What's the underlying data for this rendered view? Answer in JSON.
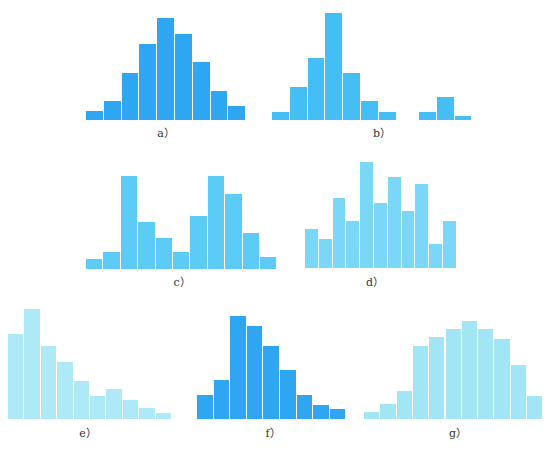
{
  "chart_data": [
    {
      "id": "a",
      "type": "bar",
      "label": "a）",
      "color": "#2ea6f2",
      "x": 86,
      "baseline": 120,
      "bar_width": 17.8,
      "values": [
        9,
        19,
        47,
        76,
        102,
        86,
        58,
        29,
        14
      ],
      "title": "",
      "xlabel": "",
      "ylabel": ""
    },
    {
      "id": "b",
      "type": "bar",
      "label": "b）",
      "color": "#45bdf5",
      "x": 272,
      "baseline": 120,
      "bar_width": 17.8,
      "values": [
        8,
        33,
        62,
        107,
        47,
        19,
        8
      ],
      "gap_group": {
        "x": 419,
        "values": [
          8,
          23,
          4
        ]
      },
      "title": "",
      "xlabel": "",
      "ylabel": ""
    },
    {
      "id": "c",
      "type": "bar",
      "label": "c）",
      "color": "#5ccbf6",
      "x": 86,
      "baseline": 269,
      "bar_width": 17.4,
      "values": [
        10,
        17,
        93,
        47,
        31,
        17,
        53,
        93,
        75,
        36,
        12
      ],
      "title": "",
      "xlabel": "",
      "ylabel": ""
    },
    {
      "id": "d",
      "type": "bar",
      "label": "d）",
      "color": "#7ad7f7",
      "x": 305,
      "baseline": 268,
      "bar_width": 13.8,
      "values": [
        39,
        29,
        70,
        47,
        106,
        65,
        91,
        57,
        84,
        24,
        47
      ],
      "title": "",
      "xlabel": "",
      "ylabel": ""
    },
    {
      "id": "e",
      "type": "bar",
      "label": "e）",
      "color": "#aee9f7",
      "x": 8,
      "baseline": 419,
      "bar_width": 16.4,
      "values": [
        85,
        110,
        73,
        57,
        38,
        23,
        30,
        19,
        11,
        6
      ],
      "title": "",
      "xlabel": "",
      "ylabel": ""
    },
    {
      "id": "f",
      "type": "bar",
      "label": "f）",
      "color": "#2ea6f2",
      "x": 197,
      "baseline": 419,
      "bar_width": 16.6,
      "values": [
        24,
        39,
        103,
        93,
        73,
        49,
        24,
        14,
        10
      ],
      "title": "",
      "xlabel": "",
      "ylabel": ""
    },
    {
      "id": "g",
      "type": "bar",
      "label": "g）",
      "color": "#a2e6f6",
      "x": 364,
      "baseline": 419,
      "bar_width": 16.3,
      "values": [
        7,
        15,
        28,
        73,
        82,
        90,
        98,
        90,
        80,
        54,
        23
      ],
      "title": "",
      "xlabel": "",
      "ylabel": ""
    }
  ],
  "labels": {
    "a": {
      "text": "a）",
      "x": 146,
      "y": 124
    },
    "b": {
      "text": "b）",
      "x": 362,
      "y": 124
    },
    "c": {
      "text": "c）",
      "x": 162,
      "y": 273
    },
    "d": {
      "text": "d）",
      "x": 355,
      "y": 273
    },
    "e": {
      "text": "e）",
      "x": 68,
      "y": 424
    },
    "f": {
      "text": "f）",
      "x": 253,
      "y": 424
    },
    "g": {
      "text": "g）",
      "x": 438,
      "y": 424
    }
  }
}
